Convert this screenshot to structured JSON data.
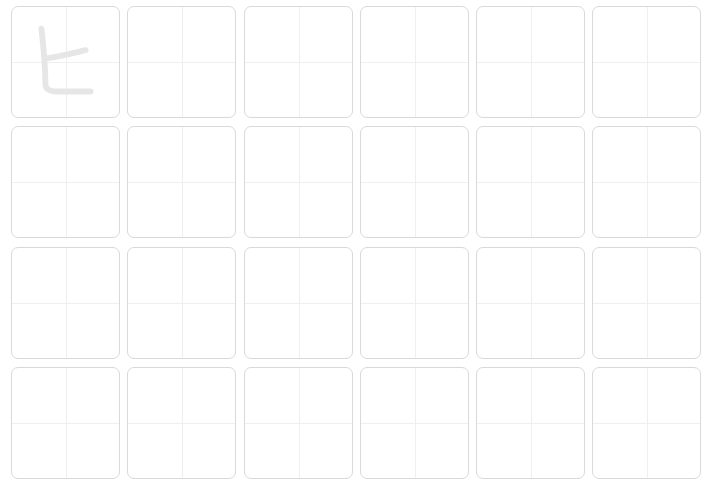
{
  "worksheet": {
    "rows": 4,
    "columns": 6,
    "trace_character": "ヒ",
    "trace_cell_index": 0,
    "colors": {
      "cell_border": "#d9d9d9",
      "guide_line": "#efefef",
      "trace_stroke": "#e6e6e6",
      "background": "#ffffff"
    },
    "column_x": [
      11,
      127,
      244,
      360,
      476,
      592
    ],
    "row_y": [
      6,
      126,
      247,
      367
    ]
  }
}
